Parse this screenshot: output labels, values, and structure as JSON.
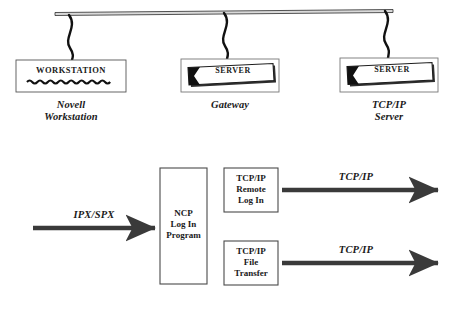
{
  "diagram": {
    "background_color": "#ffffff",
    "line_color": "#1a1a1a",
    "arrow_color": "#3a3a3a",
    "box_fill": "#ffffff"
  },
  "network_bus": {
    "name": "network-backbone-cable",
    "drop_count": 3
  },
  "devices": [
    {
      "icon": "workstation-icon",
      "icon_label": "WORKSTATION",
      "caption": "Novell\nWorkstation"
    },
    {
      "icon": "server-icon",
      "icon_label": "SERVER",
      "caption": "Gateway"
    },
    {
      "icon": "server-icon",
      "icon_label": "SERVER",
      "caption": "TCP/IP\nServer"
    }
  ],
  "flow": {
    "input_arrow_label": "IPX/SPX",
    "gateway_process": "NCP\nLog In\nProgram",
    "services": [
      {
        "label": "TCP/IP\nRemote\nLog  In",
        "output_arrow_label": "TCP/IP"
      },
      {
        "label": "TCP/IP\nFile\nTransfer",
        "output_arrow_label": "TCP/IP"
      }
    ]
  }
}
